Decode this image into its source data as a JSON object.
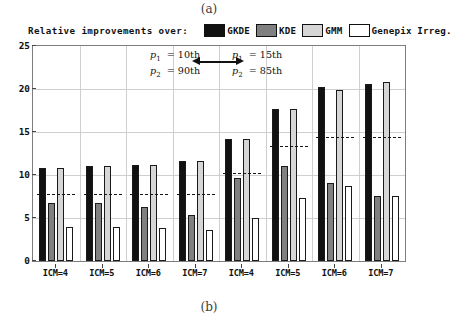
{
  "figure": {
    "caption_top": "(a)",
    "caption_bottom": "(b)"
  },
  "legend": {
    "title": "Relative improvements over:",
    "entries": [
      {
        "label": "GKDE",
        "color": "#111111"
      },
      {
        "label": "KDE",
        "color": "#808080"
      },
      {
        "label": "GMM",
        "color": "#d6d6d6"
      },
      {
        "label": "Genepix Irreg.",
        "color": "#ffffff"
      }
    ]
  },
  "annotations": {
    "left": {
      "line1_var": "p",
      "line1_sub": "1",
      "line1_val": "= 10th",
      "line2_var": "p",
      "line2_sub": "2",
      "line2_val": "= 90th"
    },
    "right": {
      "line1_var": "p",
      "line1_sub": "1",
      "line1_val": "= 15th",
      "line2_var": "p",
      "line2_sub": "2",
      "line2_val": "= 85th"
    }
  },
  "chart_data": {
    "type": "bar",
    "title": "Relative improvements over:",
    "xlabel": "",
    "ylabel": "",
    "ylim": [
      0,
      25
    ],
    "yticks": [
      0,
      5,
      10,
      15,
      20,
      25
    ],
    "grid": true,
    "legend_position": "top",
    "categories": [
      "ICM=4",
      "ICM=5",
      "ICM=6",
      "ICM=7",
      "ICM=4",
      "ICM=5",
      "ICM=6",
      "ICM=7"
    ],
    "panels": [
      {
        "name": "p1 = 10th, p2 = 90th",
        "categories": [
          "ICM=4",
          "ICM=5",
          "ICM=6",
          "ICM=7"
        ]
      },
      {
        "name": "p1 = 15th, p2 = 85th",
        "categories": [
          "ICM=4",
          "ICM=5",
          "ICM=6",
          "ICM=7"
        ]
      }
    ],
    "series": [
      {
        "name": "GKDE",
        "color": "#111111",
        "values": [
          10.8,
          11.0,
          11.2,
          11.6,
          14.2,
          17.7,
          20.2,
          20.6
        ]
      },
      {
        "name": "KDE",
        "color": "#808080",
        "values": [
          6.8,
          6.8,
          6.3,
          5.3,
          9.7,
          11.0,
          9.1,
          7.6
        ]
      },
      {
        "name": "GMM",
        "color": "#d6d6d6",
        "values": [
          10.8,
          11.0,
          11.2,
          11.6,
          14.2,
          17.7,
          19.9,
          20.8
        ]
      },
      {
        "name": "Genepix Irreg.",
        "color": "#ffffff",
        "values": [
          3.9,
          3.9,
          3.8,
          3.6,
          5.0,
          7.3,
          8.7,
          7.6
        ]
      }
    ],
    "reference_lines": [
      7.8,
      7.8,
      7.8,
      7.8,
      10.2,
      13.4,
      14.4,
      14.4
    ]
  }
}
